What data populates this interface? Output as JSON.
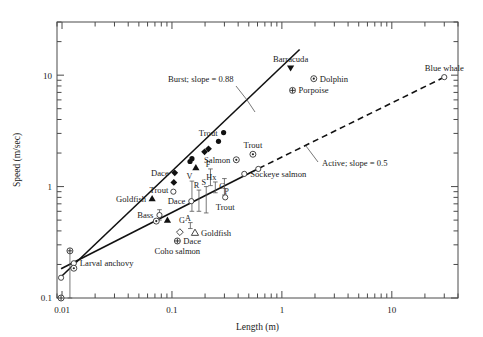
{
  "figure": {
    "name": "swimming-speed-vs-length-log-log-scatter"
  },
  "chart_data": {
    "type": "scatter",
    "title": "",
    "xlabel": "Length (m)",
    "ylabel": "Speed (m/sec)",
    "xscale": "log",
    "yscale": "log",
    "xlim": [
      0.009,
      40
    ],
    "ylim": [
      0.1,
      30
    ],
    "grid": false,
    "legend_position": "none",
    "xticks": [
      0.01,
      0.1,
      1,
      10
    ],
    "xticklabels": [
      "0.01",
      "0.1",
      "1",
      "10"
    ],
    "yticks": [
      0.1,
      1,
      10
    ],
    "yticklabels": [
      "0.1",
      "1",
      "10"
    ],
    "fit_lines": [
      {
        "name": "Burst",
        "label": "Burst; slope = 0.88",
        "slope": 0.88,
        "style": "solid",
        "x_start": 0.0098,
        "y_start": 0.155,
        "x_end": 1.45,
        "y_end": 17.0
      },
      {
        "name": "Active",
        "label": "Active; slope = 0.5",
        "slope": 0.5,
        "style": "solid-then-dashed",
        "x_start": 0.0098,
        "y_start": 0.183,
        "x_dash_start": 0.62,
        "y_dash_start": 1.46,
        "x_end": 30.0,
        "y_end": 9.6
      }
    ],
    "points": [
      {
        "label": "Barracuda",
        "x": 1.2,
        "y": 11.6,
        "marker": "filled-triangle-down",
        "label_pos": "above"
      },
      {
        "label": "Dolphin",
        "x": 1.95,
        "y": 9.3,
        "marker": "circle-dot",
        "label_pos": "right"
      },
      {
        "label": "Porpoise",
        "x": 1.25,
        "y": 7.3,
        "marker": "circle-plus",
        "label_pos": "right"
      },
      {
        "label": "Blue whale",
        "x": 30.0,
        "y": 9.6,
        "marker": "open-circle",
        "label_pos": "above"
      },
      {
        "label": "Trout",
        "x": 0.295,
        "y": 3.05,
        "marker": "filled-circle",
        "label_pos": "left"
      },
      {
        "label": "",
        "x": 0.265,
        "y": 2.55,
        "marker": "filled-circle",
        "label_pos": "none"
      },
      {
        "label": "",
        "x": 0.215,
        "y": 2.18,
        "marker": "filled-diamond",
        "label_pos": "none"
      },
      {
        "label": "",
        "x": 0.198,
        "y": 2.05,
        "marker": "filled-diamond",
        "label_pos": "none"
      },
      {
        "label": "",
        "x": 0.152,
        "y": 1.78,
        "marker": "filled-circle",
        "label_pos": "none"
      },
      {
        "label": "",
        "x": 0.146,
        "y": 1.68,
        "marker": "filled-circle",
        "label_pos": "none"
      },
      {
        "label": "",
        "x": 0.165,
        "y": 1.48,
        "marker": "filled-triangle-up",
        "label_pos": "none"
      },
      {
        "label": "Dace",
        "x": 0.106,
        "y": 1.33,
        "marker": "filled-diamond",
        "label_pos": "left"
      },
      {
        "label": "",
        "x": 0.104,
        "y": 1.09,
        "marker": "filled-diamond",
        "label_pos": "none"
      },
      {
        "label": "Goldfish",
        "x": 0.066,
        "y": 0.78,
        "marker": "filled-triangle-up",
        "label_pos": "left"
      },
      {
        "label": "Trout",
        "x": 0.103,
        "y": 0.9,
        "marker": "open-circle",
        "label_pos": "left-above"
      },
      {
        "label": "Dace",
        "x": 0.15,
        "y": 0.74,
        "marker": "open-circle",
        "label_pos": "left"
      },
      {
        "label": "Bass",
        "x": 0.077,
        "y": 0.555,
        "marker": "open-circle",
        "label_pos": "left"
      },
      {
        "label": "",
        "x": 0.072,
        "y": 0.49,
        "marker": "circle-dot",
        "label_pos": "none"
      },
      {
        "label": "",
        "x": 0.091,
        "y": 0.5,
        "marker": "filled-triangle-up",
        "label_pos": "none"
      },
      {
        "label": "",
        "x": 0.118,
        "y": 0.39,
        "marker": "open-diamond",
        "label_pos": "none"
      },
      {
        "label": "Dace",
        "x": 0.112,
        "y": 0.325,
        "marker": "circle-plus",
        "label_pos": "right"
      },
      {
        "label": "Coho salmon",
        "x": 0.112,
        "y": 0.325,
        "marker": "none",
        "label_pos": "below"
      },
      {
        "label": "Goldfish",
        "x": 0.162,
        "y": 0.385,
        "marker": "open-triangle-up",
        "label_pos": "right"
      },
      {
        "label": "Salmon",
        "x": 0.385,
        "y": 1.74,
        "marker": "circle-dot",
        "label_pos": "left"
      },
      {
        "label": "Trout",
        "x": 0.545,
        "y": 1.95,
        "marker": "circle-dot",
        "label_pos": "above"
      },
      {
        "label": "Sockeye salmon",
        "x": 0.455,
        "y": 1.3,
        "marker": "open-circle",
        "label_pos": "right"
      },
      {
        "label": "",
        "x": 0.61,
        "y": 1.44,
        "marker": "open-circle",
        "label_pos": "none"
      },
      {
        "label": "Trout",
        "x": 0.305,
        "y": 0.8,
        "marker": "open-circle",
        "label_pos": "below"
      },
      {
        "label": "Larval anchovy",
        "x": 0.0128,
        "y": 0.205,
        "marker": "open-circle",
        "label_pos": "right"
      },
      {
        "label": "",
        "x": 0.0118,
        "y": 0.265,
        "marker": "circle-plus",
        "label_pos": "none"
      },
      {
        "label": "",
        "x": 0.0128,
        "y": 0.185,
        "marker": "circle-dot",
        "label_pos": "none"
      },
      {
        "label": "",
        "x": 0.0098,
        "y": 0.152,
        "marker": "open-circle",
        "label_pos": "none"
      },
      {
        "label": "",
        "x": 0.0098,
        "y": 0.1,
        "marker": "circle-plus",
        "label_pos": "none"
      }
    ],
    "code_labels": [
      {
        "code": "F",
        "x": 0.224,
        "y": 1.44
      },
      {
        "code": "V",
        "x": 0.152,
        "y": 1.12
      },
      {
        "code": "R",
        "x": 0.176,
        "y": 0.93
      },
      {
        "code": "S",
        "x": 0.205,
        "y": 1.0
      },
      {
        "code": "Hx",
        "x": 0.24,
        "y": 1.1
      },
      {
        "code": "C",
        "x": 0.3,
        "y": 0.92
      },
      {
        "code": "P",
        "x": 0.33,
        "y": 0.82
      },
      {
        "code": "G",
        "x": 0.13,
        "y": 0.455
      },
      {
        "code": "A",
        "x": 0.147,
        "y": 0.475
      }
    ],
    "error_bars": [
      {
        "x": 0.152,
        "y_low": 0.6,
        "y_high": 1.12
      },
      {
        "x": 0.176,
        "y_low": 0.6,
        "y_high": 0.93
      },
      {
        "x": 0.205,
        "y_low": 0.58,
        "y_high": 1.0
      },
      {
        "x": 0.224,
        "y_low": 1.02,
        "y_high": 1.44
      },
      {
        "x": 0.248,
        "y_low": 0.88,
        "y_high": 1.1
      },
      {
        "x": 0.3,
        "y_low": 0.84,
        "y_high": 1.18
      },
      {
        "x": 0.147,
        "y_low": 0.42,
        "y_high": 0.475
      },
      {
        "x": 0.077,
        "y_low": 0.5,
        "y_high": 0.62
      },
      {
        "x": 0.0118,
        "y_low": 0.1,
        "y_high": 0.265
      }
    ]
  },
  "annotations": {
    "burst_label": "Burst; slope = 0.88",
    "active_label": "Active; slope = 0.5"
  },
  "colors": {
    "axis": "#4a4a4a",
    "ink": "#1a1a1a",
    "line": "#111111",
    "marker_fill": "#111111",
    "marker_open": "#ffffff"
  }
}
